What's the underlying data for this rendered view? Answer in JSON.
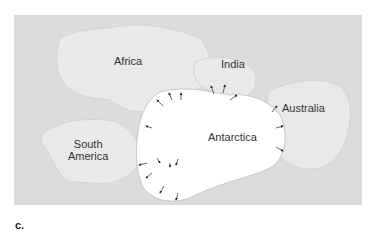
{
  "figure": {
    "label": "c."
  },
  "continents": {
    "africa": "Africa",
    "india": "India",
    "australia": "Australia",
    "south_america_line1": "South",
    "south_america_line2": "America",
    "antarctica": "Antarctica"
  },
  "colors": {
    "ocean": "#dcdcdc",
    "land": "#e9e9e9",
    "ice": "#ffffff",
    "arrow": "#222222",
    "text": "#333333"
  }
}
